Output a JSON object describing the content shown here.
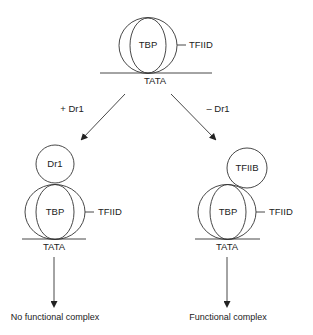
{
  "diagram": {
    "top_complex": {
      "inner_label": "TBP",
      "outer_label": "TFIID",
      "dna_label": "TATA"
    },
    "branches": {
      "left": {
        "arrow_label": "+ Dr1",
        "bound_factor": "Dr1",
        "inner_label": "TBP",
        "outer_label": "TFIID",
        "dna_label": "TATA",
        "outcome": "No functional complex"
      },
      "right": {
        "arrow_label": "– Dr1",
        "bound_factor": "TFIIB",
        "inner_label": "TBP",
        "outer_label": "TFIID",
        "dna_label": "TATA",
        "outcome": "Functional complex"
      }
    },
    "colors": {
      "line": "#333333",
      "text": "#222222",
      "background": "#ffffff"
    }
  }
}
